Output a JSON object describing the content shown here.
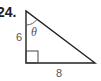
{
  "problem": {
    "number": "24."
  },
  "triangle": {
    "vertical_side_label": "6",
    "horizontal_side_label": "8",
    "angle_label": "θ",
    "right_angle_marker": true,
    "line_color": "#222222",
    "label_color": "#555555"
  }
}
